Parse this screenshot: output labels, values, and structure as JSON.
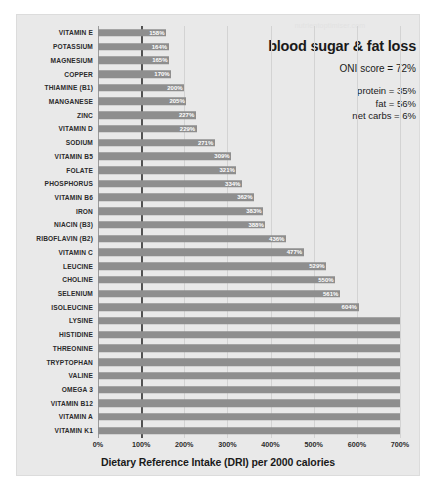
{
  "watermark": "nutrientoptimiser.com",
  "annotation": {
    "headline": "blood sugar & fat loss",
    "oni_label": "ONI score = 72%",
    "protein_label": "protein = 35%",
    "fat_label": "fat = 56%",
    "net_carbs_label": "net carbs = 6%"
  },
  "axis": {
    "title": "Dietary Reference Intake (DRI) per 2000 calories",
    "ticks": [
      "0%",
      "100%",
      "200%",
      "300%",
      "400%",
      "500%",
      "600%",
      "700%"
    ]
  },
  "colors": {
    "bar": "#8e8e8e",
    "panel": "#e9e9e9",
    "grid": "#d3d3d3",
    "marker": "#3a3a3a",
    "value_label": "#ffffff"
  },
  "chart_data": {
    "type": "bar",
    "orientation": "horizontal",
    "title": "blood sugar & fat loss",
    "xlabel": "Dietary Reference Intake (DRI) per 2000 calories",
    "ylabel": "",
    "xlim": [
      0,
      700
    ],
    "xtick_step": 100,
    "grid": true,
    "legend": "none",
    "reference_line": 100,
    "units": "percent of DRI",
    "note": "Bars without a printed value extend beyond the 700% axis maximum.",
    "categories": [
      "VITAMIN E",
      "POTASSIUM",
      "MAGNESIUM",
      "COPPER",
      "THIAMINE (B1)",
      "MANGANESE",
      "ZINC",
      "VITAMIN D",
      "SODIUM",
      "VITAMIN B5",
      "FOLATE",
      "PHOSPHORUS",
      "VITAMIN B6",
      "IRON",
      "NIACIN (B3)",
      "RIBOFLAVIN (B2)",
      "VITAMIN C",
      "LEUCINE",
      "CHOLINE",
      "SELENIUM",
      "ISOLEUCINE",
      "LYSINE",
      "HISTIDINE",
      "THREONINE",
      "TRYPTOPHAN",
      "VALINE",
      "OMEGA 3",
      "VITAMIN B12",
      "VITAMIN A",
      "VITAMIN K1"
    ],
    "values": [
      158,
      164,
      165,
      170,
      200,
      205,
      227,
      229,
      271,
      309,
      321,
      334,
      362,
      383,
      388,
      436,
      477,
      529,
      550,
      561,
      604,
      700,
      700,
      700,
      700,
      700,
      700,
      700,
      700,
      700
    ],
    "labels": [
      "158%",
      "164%",
      "165%",
      "170%",
      "200%",
      "205%",
      "227%",
      "229%",
      "271%",
      "309%",
      "321%",
      "334%",
      "362%",
      "383%",
      "388%",
      "436%",
      "477%",
      "529%",
      "550%",
      "561%",
      "604%",
      "",
      "",
      "",
      "",
      "",
      "",
      "",
      "",
      ""
    ]
  }
}
